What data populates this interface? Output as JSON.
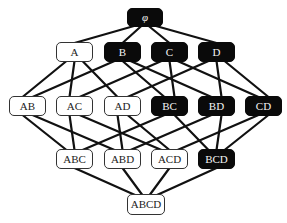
{
  "diagram": {
    "type": "hasse-lattice",
    "colors": {
      "dark_fill": "#0a0a0a",
      "light_fill": "#ffffff",
      "edge": "#111111"
    },
    "nodes": [
      {
        "id": "phi",
        "label": "φ",
        "style": "dark",
        "x": 127,
        "y": 8,
        "w": 36,
        "h": 19
      },
      {
        "id": "A",
        "label": "A",
        "style": "light",
        "x": 56,
        "y": 42,
        "w": 37,
        "h": 20
      },
      {
        "id": "B",
        "label": "B",
        "style": "dark",
        "x": 104,
        "y": 42,
        "w": 37,
        "h": 20
      },
      {
        "id": "C",
        "label": "C",
        "style": "dark",
        "x": 151,
        "y": 42,
        "w": 37,
        "h": 20
      },
      {
        "id": "D",
        "label": "D",
        "style": "dark",
        "x": 198,
        "y": 42,
        "w": 37,
        "h": 20
      },
      {
        "id": "AB",
        "label": "AB",
        "style": "light",
        "x": 9,
        "y": 96,
        "w": 37,
        "h": 20
      },
      {
        "id": "AC",
        "label": "AC",
        "style": "light",
        "x": 56,
        "y": 96,
        "w": 37,
        "h": 20
      },
      {
        "id": "AD",
        "label": "AD",
        "style": "light",
        "x": 104,
        "y": 96,
        "w": 37,
        "h": 20
      },
      {
        "id": "BC",
        "label": "BC",
        "style": "dark",
        "x": 151,
        "y": 96,
        "w": 37,
        "h": 20
      },
      {
        "id": "BD",
        "label": "BD",
        "style": "dark",
        "x": 198,
        "y": 96,
        "w": 37,
        "h": 20
      },
      {
        "id": "CD",
        "label": "CD",
        "style": "dark",
        "x": 245,
        "y": 96,
        "w": 37,
        "h": 20
      },
      {
        "id": "ABC",
        "label": "ABC",
        "style": "light",
        "x": 56,
        "y": 149,
        "w": 37,
        "h": 20
      },
      {
        "id": "ABD",
        "label": "ABD",
        "style": "light",
        "x": 104,
        "y": 149,
        "w": 37,
        "h": 20
      },
      {
        "id": "ACD",
        "label": "ACD",
        "style": "light",
        "x": 151,
        "y": 149,
        "w": 37,
        "h": 20
      },
      {
        "id": "BCD",
        "label": "BCD",
        "style": "dark",
        "x": 198,
        "y": 149,
        "w": 37,
        "h": 20
      },
      {
        "id": "ABCD",
        "label": "ABCD",
        "style": "light",
        "x": 127,
        "y": 194,
        "w": 38,
        "h": 21
      }
    ],
    "edges": [
      [
        "phi",
        "A"
      ],
      [
        "phi",
        "B"
      ],
      [
        "phi",
        "C"
      ],
      [
        "phi",
        "D"
      ],
      [
        "A",
        "AB"
      ],
      [
        "A",
        "AC"
      ],
      [
        "A",
        "AD"
      ],
      [
        "B",
        "AB"
      ],
      [
        "B",
        "BC"
      ],
      [
        "B",
        "BD"
      ],
      [
        "C",
        "AC"
      ],
      [
        "C",
        "BC"
      ],
      [
        "C",
        "CD"
      ],
      [
        "D",
        "AD"
      ],
      [
        "D",
        "BD"
      ],
      [
        "D",
        "CD"
      ],
      [
        "AB",
        "ABC"
      ],
      [
        "AB",
        "ABD"
      ],
      [
        "AC",
        "ABC"
      ],
      [
        "AC",
        "ACD"
      ],
      [
        "AD",
        "ABD"
      ],
      [
        "AD",
        "ACD"
      ],
      [
        "BC",
        "ABC"
      ],
      [
        "BC",
        "BCD"
      ],
      [
        "BD",
        "ABD"
      ],
      [
        "BD",
        "BCD"
      ],
      [
        "CD",
        "ACD"
      ],
      [
        "CD",
        "BCD"
      ],
      [
        "ABC",
        "ABCD"
      ],
      [
        "ABD",
        "ABCD"
      ],
      [
        "ACD",
        "ABCD"
      ],
      [
        "BCD",
        "ABCD"
      ]
    ]
  }
}
